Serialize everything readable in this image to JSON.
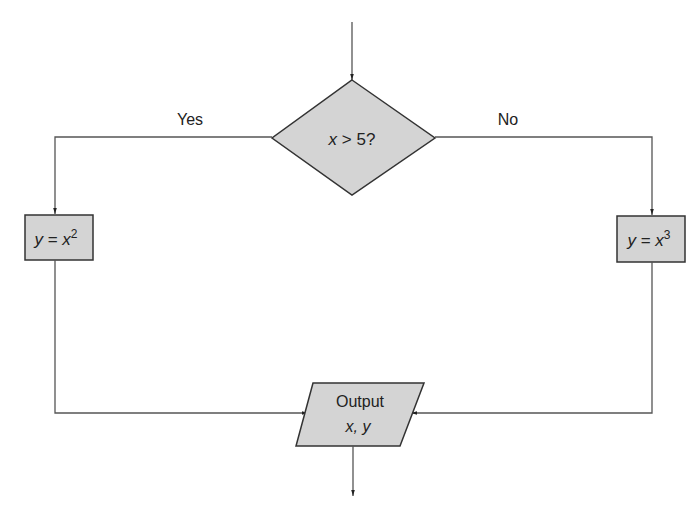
{
  "diagram": {
    "type": "flowchart",
    "colors": {
      "shape_fill": "#d4d4d4",
      "stroke": "#333333",
      "line": "#555555",
      "text": "#222222"
    },
    "nodes": {
      "decision": {
        "var": "x",
        "op": " > ",
        "rest": "5?"
      },
      "yes_process": {
        "lhs": "y",
        "eq": " = ",
        "base": "x",
        "exp": "2"
      },
      "no_process": {
        "lhs": "y",
        "eq": " = ",
        "base": "x",
        "exp": "3"
      },
      "output": {
        "line1": "Output",
        "line2": "x, y"
      }
    },
    "edges": {
      "yes_label": "Yes",
      "no_label": "No"
    }
  }
}
